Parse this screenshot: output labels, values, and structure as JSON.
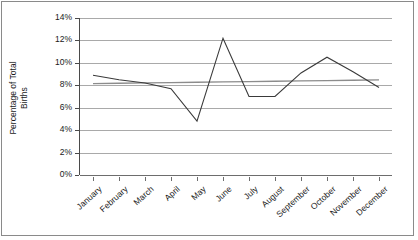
{
  "chart_data": {
    "type": "line",
    "title": "",
    "xlabel": "",
    "ylabel": "Percentage of Total Births",
    "ylabel_lines": [
      "Percentage of Total",
      "Births"
    ],
    "categories": [
      "January",
      "February",
      "March",
      "April",
      "May",
      "June",
      "July",
      "August",
      "September",
      "October",
      "November",
      "December"
    ],
    "ytick_labels": [
      "14%",
      "12%",
      "10%",
      "8%",
      "6%",
      "4%",
      "2%",
      "0%"
    ],
    "ytick_values": [
      14,
      12,
      10,
      8,
      6,
      4,
      2,
      0
    ],
    "ylim": [
      0,
      14
    ],
    "ytick_step": 2,
    "grid": true,
    "legend": "none",
    "value_suffix": "%",
    "series": [
      {
        "name": "Percentage of Total Births",
        "type": "line",
        "color": "#3a3a3a",
        "values": [
          8.9,
          8.5,
          8.2,
          7.7,
          4.8,
          12.2,
          7.0,
          7.0,
          9.1,
          10.5,
          9.2,
          7.8
        ]
      },
      {
        "name": "Trendline",
        "type": "line",
        "color": "#8c8c8c",
        "values": [
          8.15,
          8.18,
          8.21,
          8.24,
          8.27,
          8.3,
          8.33,
          8.36,
          8.39,
          8.42,
          8.45,
          8.48
        ]
      }
    ]
  },
  "colors": {
    "series_line": "#3a3a3a",
    "trend_line": "#8c8c8c",
    "gridline": "#a9a9a9",
    "axis": "#4a4a4a",
    "border": "#8a8a8a",
    "background": "#ffffff",
    "text": "#1a1a1a"
  }
}
